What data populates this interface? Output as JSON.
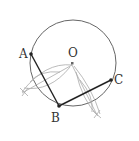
{
  "diagram": {
    "type": "geometry-construction",
    "points": {
      "A": {
        "label": "A"
      },
      "B": {
        "label": "B"
      },
      "C": {
        "label": "C"
      },
      "O": {
        "label": "O"
      }
    },
    "segments": [
      "AB",
      "BC"
    ],
    "colors": {
      "circle": "#555555",
      "segment": "#222222",
      "construction": "#aaaaaa",
      "point": "#222222",
      "center": "#666666"
    }
  }
}
